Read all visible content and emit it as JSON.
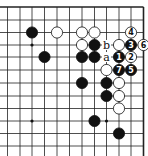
{
  "diagram": {
    "type": "go-board-fragment",
    "corner": "top-right",
    "grid": {
      "cols_x": [
        7.5,
        20,
        32,
        44.5,
        57,
        69.5,
        82,
        94.5,
        106.5,
        119,
        131,
        143.5
      ],
      "rows_y": [
        7,
        20,
        32.5,
        45,
        57,
        70,
        83,
        96,
        108.5,
        121,
        133.5,
        146
      ],
      "edge_top": true,
      "edge_right": true,
      "line_color": "#222222",
      "stone_radius": 5.6
    },
    "star_points": [
      {
        "col": 2,
        "row": 3
      },
      {
        "col": 2,
        "row": 9
      },
      {
        "col": 8,
        "row": 9
      }
    ],
    "stones": [
      {
        "col": 2,
        "row": 2,
        "color": "black",
        "label": ""
      },
      {
        "col": 4,
        "row": 2,
        "color": "white",
        "label": ""
      },
      {
        "col": 6,
        "row": 2,
        "color": "white",
        "label": ""
      },
      {
        "col": 7,
        "row": 2,
        "color": "white",
        "label": ""
      },
      {
        "col": 10,
        "row": 2,
        "color": "white",
        "label": "4"
      },
      {
        "col": 6,
        "row": 3,
        "color": "white",
        "label": ""
      },
      {
        "col": 7,
        "row": 3,
        "color": "black",
        "label": ""
      },
      {
        "col": 9,
        "row": 3,
        "color": "white",
        "label": ""
      },
      {
        "col": 10,
        "row": 3,
        "color": "black",
        "label": "3"
      },
      {
        "col": 11,
        "row": 3,
        "color": "white",
        "label": "6"
      },
      {
        "col": 3,
        "row": 4,
        "color": "black",
        "label": ""
      },
      {
        "col": 6,
        "row": 4,
        "color": "black",
        "label": ""
      },
      {
        "col": 7,
        "row": 4,
        "color": "black",
        "label": ""
      },
      {
        "col": 9,
        "row": 4,
        "color": "black",
        "label": "1"
      },
      {
        "col": 10,
        "row": 4,
        "color": "white",
        "label": "2"
      },
      {
        "col": 8,
        "row": 5,
        "color": "white",
        "label": ""
      },
      {
        "col": 9,
        "row": 5,
        "color": "black",
        "label": "7"
      },
      {
        "col": 10,
        "row": 5,
        "color": "black",
        "label": "5"
      },
      {
        "col": 6,
        "row": 6,
        "color": "black",
        "label": ""
      },
      {
        "col": 8,
        "row": 6,
        "color": "black",
        "label": ""
      },
      {
        "col": 9,
        "row": 6,
        "color": "white",
        "label": ""
      },
      {
        "col": 8,
        "row": 7,
        "color": "black",
        "label": ""
      },
      {
        "col": 9,
        "row": 7,
        "color": "white",
        "label": ""
      },
      {
        "col": 9,
        "row": 8,
        "color": "white",
        "label": ""
      },
      {
        "col": 7,
        "row": 9,
        "color": "black",
        "label": ""
      },
      {
        "col": 9,
        "row": 10,
        "color": "black",
        "label": ""
      }
    ],
    "marks": [
      {
        "col": 8,
        "row": 3,
        "text": "b"
      },
      {
        "col": 8,
        "row": 4,
        "text": "a"
      }
    ]
  }
}
